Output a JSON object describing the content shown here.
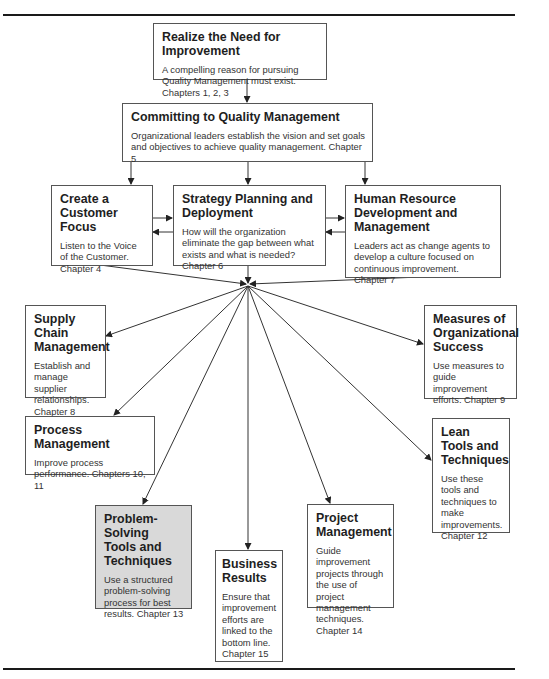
{
  "diagram": {
    "hub": {
      "x": 248,
      "y": 285
    },
    "boxes": [
      {
        "id": "realize-need",
        "title": "Realize the Need for Improvement",
        "description": "A compelling reason for pursuing Quality Management must exist. Chapters 1, 2, 3"
      },
      {
        "id": "committing",
        "title": "Committing to Quality Management",
        "description": "Organizational leaders establish the vision and set goals and objectives to achieve quality management. Chapter 5"
      },
      {
        "id": "customer-focus",
        "title": "Create a Customer Focus",
        "description": "Listen to the Voice of the Customer. Chapter 4"
      },
      {
        "id": "strategy",
        "title": "Strategy Planning and Deployment",
        "description": "How will the organization eliminate the gap between what exists and what is needed? Chapter 6"
      },
      {
        "id": "human-resource",
        "title": "Human Resource Development and Management",
        "description": "Leaders act as change agents to develop a culture focused on continuous improvement. Chapter 7"
      },
      {
        "id": "supply-chain",
        "title": "Supply Chain Management",
        "description": "Establish and manage supplier relationships. Chapter 8"
      },
      {
        "id": "measures",
        "title": "Measures of Organizational Success",
        "description": "Use measures to guide improvement efforts. Chapter 9"
      },
      {
        "id": "process-mgmt",
        "title": "Process Management",
        "description": "Improve process performance. Chapters 10, 11"
      },
      {
        "id": "lean",
        "title": "Lean Tools and Techniques",
        "description": "Use these tools and techniques to make improvements. Chapter 12"
      },
      {
        "id": "problem-solving",
        "title": "Problem-Solving Tools and Techniques",
        "description": "Use a structured problem-solving process for best results. Chapter 13",
        "highlighted": true
      },
      {
        "id": "business-results",
        "title": "Business Results",
        "description": "Ensure that improvement efforts are linked to the bottom line. Chapter 15"
      },
      {
        "id": "project-mgmt",
        "title": "Project Management",
        "description": "Guide improvement projects through the use of project management techniques. Chapter 14"
      }
    ],
    "connections": [
      {
        "from": "realize-need",
        "to": "committing"
      },
      {
        "from": "committing",
        "to": "customer-focus"
      },
      {
        "from": "committing",
        "to": "strategy"
      },
      {
        "from": "committing",
        "to": "human-resource"
      },
      {
        "from": "customer-focus",
        "to": "strategy",
        "bidirectional": true
      },
      {
        "from": "strategy",
        "to": "human-resource",
        "bidirectional": true
      },
      {
        "from": "customer-focus",
        "to": "hub"
      },
      {
        "from": "strategy",
        "to": "hub"
      },
      {
        "from": "human-resource",
        "to": "hub"
      },
      {
        "from": "hub",
        "to": "supply-chain"
      },
      {
        "from": "hub",
        "to": "measures"
      },
      {
        "from": "hub",
        "to": "process-mgmt"
      },
      {
        "from": "hub",
        "to": "lean"
      },
      {
        "from": "hub",
        "to": "problem-solving"
      },
      {
        "from": "hub",
        "to": "business-results"
      },
      {
        "from": "hub",
        "to": "project-mgmt"
      }
    ],
    "highlight_color": "#d9d9d9",
    "line_color": "#333333"
  }
}
